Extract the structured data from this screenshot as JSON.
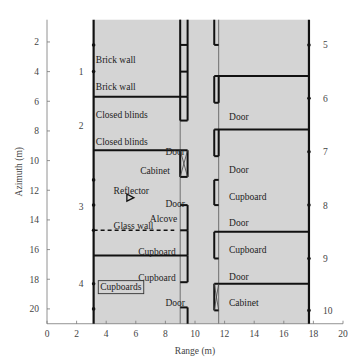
{
  "chart_data": {
    "type": "floor-plan",
    "xlabel": "Range (m)",
    "ylabel": "Azimuth (m)",
    "xlim": [
      0,
      20
    ],
    "ylim": [
      0.5,
      21
    ],
    "y_inverted": true,
    "xticks": [
      0,
      2,
      4,
      6,
      8,
      10,
      12,
      14,
      16,
      18,
      20
    ],
    "yticks": [
      2,
      4,
      6,
      8,
      10,
      12,
      14,
      16,
      18,
      20
    ],
    "background_color": "#d4d4d4",
    "line_color": "#111111",
    "corridor": {
      "x": [
        9.0,
        11.6
      ]
    },
    "left_wall_x": 3.15,
    "right_wall_x": 17.7,
    "left_room_dividers": [
      {
        "y": 5.7,
        "label_above": "Brick wall"
      },
      {
        "y": 9.3
      },
      {
        "y": 16.4
      }
    ],
    "glass_wall": {
      "y": 14.7,
      "x": [
        3.15,
        8.6
      ],
      "label": "Glass wall"
    },
    "right_room_dividers": [
      {
        "y": 4.3
      },
      {
        "y": 7.9
      },
      {
        "y": 14.8
      },
      {
        "y": 18.3
      }
    ],
    "labels": [
      {
        "text": "Brick wall",
        "x": 3.3,
        "y": 3.2
      },
      {
        "text": "Brick wall",
        "x": 3.3,
        "y": 5.0
      },
      {
        "text": "Closed blinds",
        "x": 3.3,
        "y": 6.9
      },
      {
        "text": "Closed blinds",
        "x": 3.3,
        "y": 8.7
      },
      {
        "text": "Cabinet",
        "x": 8.3,
        "y": 10.7,
        "anchor": "end"
      },
      {
        "text": "Reflector",
        "x": 4.5,
        "y": 12.0
      },
      {
        "text": "Alcove",
        "x": 8.8,
        "y": 13.9,
        "anchor": "end"
      },
      {
        "text": "Glass wall",
        "x": 4.5,
        "y": 14.4
      },
      {
        "text": "Cupboard",
        "x": 8.7,
        "y": 16.1,
        "anchor": "end"
      },
      {
        "text": "Cupboard",
        "x": 8.7,
        "y": 17.9,
        "anchor": "end"
      },
      {
        "text": "Cupboards",
        "x": 3.6,
        "y": 18.5,
        "boxed": true
      },
      {
        "text": "Door",
        "x": 8.0,
        "y": 9.4
      },
      {
        "text": "Door",
        "x": 8.0,
        "y": 12.9
      },
      {
        "text": "Door",
        "x": 8.0,
        "y": 19.6
      },
      {
        "text": "Door",
        "x": 12.3,
        "y": 7.0
      },
      {
        "text": "Door",
        "x": 12.3,
        "y": 10.6
      },
      {
        "text": "Cupboard",
        "x": 12.3,
        "y": 12.4
      },
      {
        "text": "Door",
        "x": 12.3,
        "y": 14.2
      },
      {
        "text": "Cupboard",
        "x": 12.3,
        "y": 16.0
      },
      {
        "text": "Door",
        "x": 12.3,
        "y": 17.8
      },
      {
        "text": "Cabinet",
        "x": 12.3,
        "y": 19.6
      }
    ],
    "reflector": {
      "x": 5.6,
      "y": 12.5,
      "label": "Reflector"
    },
    "left_markers": [
      {
        "label": "1",
        "y": 4.0
      },
      {
        "label": "2",
        "y": 7.6
      },
      {
        "label": "3",
        "y": 13.1
      },
      {
        "label": "4",
        "y": 18.3
      }
    ],
    "right_markers": [
      {
        "label": "5",
        "y": 2.2
      },
      {
        "label": "6",
        "y": 5.8
      },
      {
        "label": "7",
        "y": 9.4
      },
      {
        "label": "8",
        "y": 13.0
      },
      {
        "label": "9",
        "y": 16.6
      },
      {
        "label": "10",
        "y": 20.1
      }
    ],
    "left_wall_dots_y": [
      2.2,
      4.0,
      11.3,
      13.0,
      14.7,
      18.3,
      20.0
    ],
    "right_wall_dots_y": [
      2.2,
      5.8,
      9.4,
      13.0,
      16.6,
      20.1
    ]
  }
}
